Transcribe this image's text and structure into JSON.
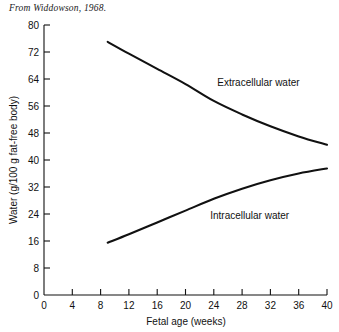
{
  "caption": "From Widdowson, 1968.",
  "chart_data": {
    "type": "line",
    "title": "",
    "xlabel": "Fetal age (weeks)",
    "ylabel": "Water (g/100 g fat-free body)",
    "xlim": [
      0,
      40
    ],
    "ylim": [
      0,
      80
    ],
    "xticks": [
      0,
      4,
      8,
      12,
      16,
      20,
      24,
      28,
      32,
      36,
      40
    ],
    "yticks": [
      0,
      8,
      16,
      24,
      32,
      40,
      48,
      56,
      64,
      72,
      80
    ],
    "grid": false,
    "legend": "inline-annotations",
    "series": [
      {
        "name": "Extracellular water",
        "label_x": 24.5,
        "label_y": 62,
        "x": [
          9,
          12,
          16,
          20,
          24,
          28,
          32,
          36,
          40
        ],
        "y": [
          75.0,
          71.5,
          67.0,
          62.5,
          57.5,
          53.5,
          50.0,
          47.0,
          44.5
        ]
      },
      {
        "name": "Intracellular water",
        "label_x": 23.5,
        "label_y": 22.5,
        "x": [
          9,
          12,
          16,
          20,
          24,
          28,
          32,
          36,
          40
        ],
        "y": [
          15.5,
          18.0,
          21.5,
          25.0,
          28.5,
          31.5,
          34.0,
          36.0,
          37.5
        ]
      }
    ],
    "annotations": [
      {
        "text": "Extracellular water"
      },
      {
        "text": "Intracellular water"
      }
    ],
    "colors": {
      "line": "#111111",
      "background": "#ffffff",
      "text": "#111111"
    }
  },
  "tick_labels": {
    "x": [
      "0",
      "4",
      "8",
      "12",
      "16",
      "20",
      "24",
      "28",
      "32",
      "36",
      "40"
    ],
    "y": [
      "0",
      "8",
      "16",
      "24",
      "32",
      "40",
      "48",
      "56",
      "64",
      "72",
      "80"
    ]
  }
}
